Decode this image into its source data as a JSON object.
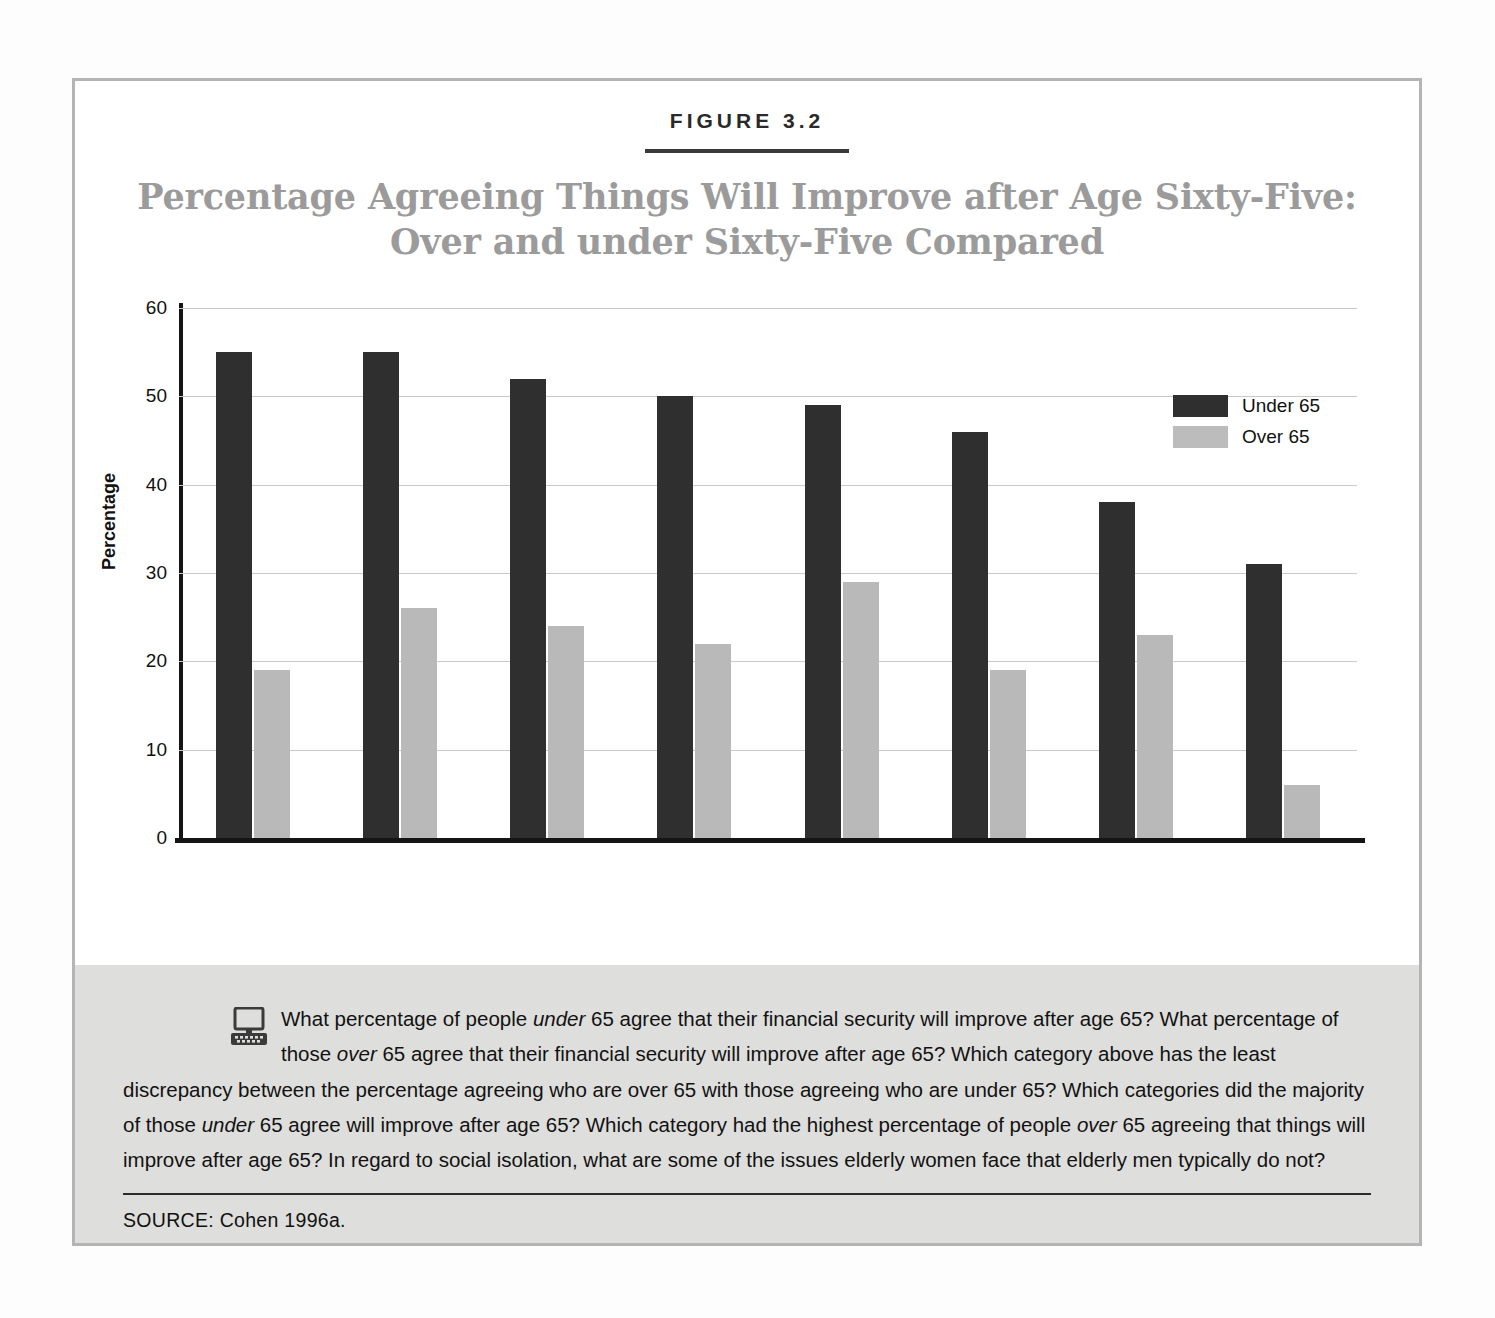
{
  "figure": {
    "number": "FIGURE 3.2",
    "title_line1": "Percentage Agreeing Things Will Improve after Age Sixty-Five:",
    "title_line2": "Over and under Sixty-Five Compared"
  },
  "chart_data": {
    "type": "bar",
    "title": "Percentage Agreeing Things Will Improve after Age Sixty-Five: Over and under Sixty-Five Compared",
    "xlabel": "",
    "ylabel": "Percentage",
    "ylim": [
      0,
      60
    ],
    "yticks": [
      "0",
      "10",
      "20",
      "30",
      "40",
      "50",
      "60"
    ],
    "grid": true,
    "legend_position": "top-right",
    "categories": [
      "Your financial\nsecurity",
      "Your\nenjoyment\nof life",
      "Feeling\npersonally\nfulfilled",
      "Your\nrelationship\nwith spouse or\ncompanion",
      "Your religious\nor spiritual\nfaith",
      "Relationships\nwith your\nchildren",
      "Relationships\nwith friends",
      "Your sex life"
    ],
    "series": [
      {
        "name": "Under 65",
        "color": "#2f2f2f",
        "values": [
          55,
          55,
          52,
          50,
          49,
          46,
          38,
          31
        ]
      },
      {
        "name": "Over 65",
        "color": "#b9b9b9",
        "values": [
          19,
          26,
          24,
          22,
          29,
          19,
          23,
          6
        ]
      }
    ]
  },
  "legend": [
    {
      "label": "Under 65"
    },
    {
      "label": "Over 65"
    }
  ],
  "caption": {
    "icon": "computer-icon",
    "text_parts": [
      {
        "t": "What percentage of people "
      },
      {
        "t": "under",
        "i": true
      },
      {
        "t": " 65 agree that their financial security will improve after age 65? What percentage of those "
      },
      {
        "t": "over",
        "i": true
      },
      {
        "t": " 65 agree that their financial security will improve after age 65? Which category above has the least discrepancy between the percentage agreeing who are over 65 with those agreeing who are under 65? Which categories did the majority of those "
      },
      {
        "t": "under",
        "i": true
      },
      {
        "t": " 65 agree will improve after age 65? Which category had the highest percentage of people "
      },
      {
        "t": "over",
        "i": true
      },
      {
        "t": " 65 agreeing that things will improve after age 65? In regard to social isolation, what are some of the issues elderly women face that elderly men typically do not?"
      }
    ],
    "source": "SOURCE:  Cohen 1996a."
  },
  "colors": {
    "under65": "#2f2f2f",
    "over65": "#b9b9b9",
    "frame": "#b4b4b4",
    "title": "#9b9b9b",
    "panel": "#dededc"
  }
}
